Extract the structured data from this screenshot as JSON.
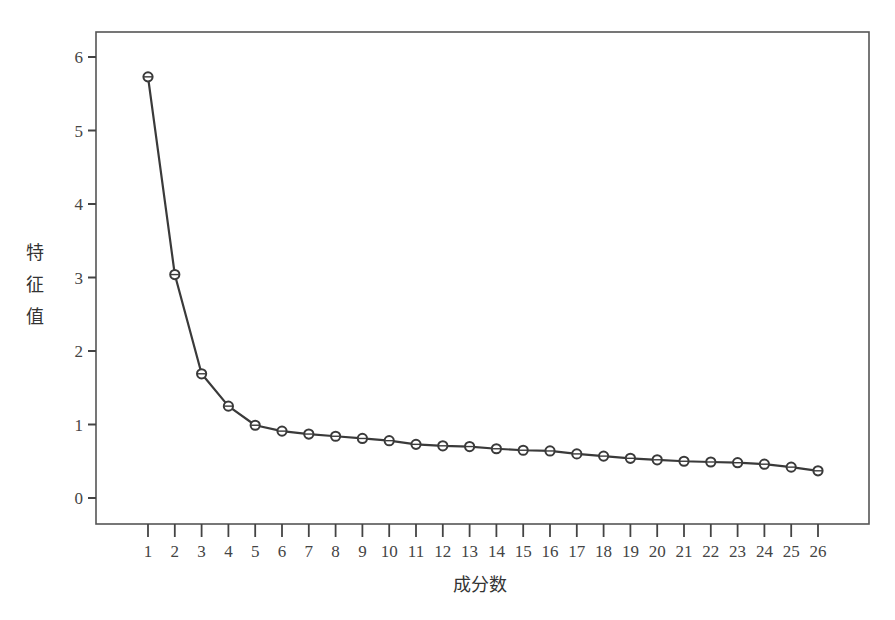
{
  "chart_data": {
    "type": "line",
    "title": "",
    "xlabel": "成分数",
    "ylabel": "特征值",
    "ylabel_chars": [
      "特",
      "征",
      "值"
    ],
    "x": [
      1,
      2,
      3,
      4,
      5,
      6,
      7,
      8,
      9,
      10,
      11,
      12,
      13,
      14,
      15,
      16,
      17,
      18,
      19,
      20,
      21,
      22,
      23,
      24,
      25,
      26
    ],
    "values": [
      5.73,
      3.04,
      1.69,
      1.25,
      0.99,
      0.91,
      0.87,
      0.84,
      0.81,
      0.78,
      0.73,
      0.71,
      0.7,
      0.67,
      0.65,
      0.64,
      0.6,
      0.57,
      0.54,
      0.52,
      0.5,
      0.49,
      0.48,
      0.46,
      0.42,
      0.37
    ],
    "x_ticks": [
      "1",
      "2",
      "3",
      "4",
      "5",
      "6",
      "7",
      "8",
      "9",
      "10",
      "11",
      "12",
      "13",
      "14",
      "15",
      "16",
      "17",
      "18",
      "19",
      "20",
      "21",
      "22",
      "23",
      "24",
      "25",
      "26"
    ],
    "y_ticks": [
      "0",
      "1",
      "2",
      "3",
      "4",
      "5",
      "6"
    ],
    "ylim": [
      -0.35,
      6.35
    ],
    "xlim": [
      0,
      27.9
    ],
    "grid": false,
    "legend": null,
    "marker": "open-circle",
    "line_color": "#3a3a3a"
  }
}
